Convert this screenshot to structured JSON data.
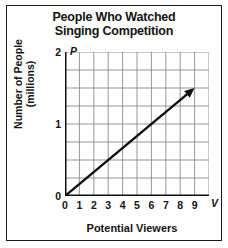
{
  "figure": {
    "title_line1": "People Who Watched",
    "title_line2": "Singing Competition",
    "ylabel_line1": "Number of People",
    "ylabel_line2": "(millions)",
    "xlabel": "Potential Viewers",
    "x_axis_variable": "V",
    "y_axis_variable": "P",
    "frame_color": "#1a1a1a",
    "grid_color": "#8a8a8a",
    "axis_color": "#111111",
    "line_color": "#111111",
    "background_color": "#ffffff"
  },
  "chart_data": {
    "type": "line",
    "title": "People Who Watched Singing Competition",
    "xlabel": "Potential Viewers",
    "ylabel": "Number of People (millions)",
    "x_axis_variable": "V",
    "y_axis_variable": "P",
    "xlim": [
      0,
      10
    ],
    "ylim": [
      0,
      2
    ],
    "xticks": [
      0,
      1,
      2,
      3,
      4,
      5,
      6,
      7,
      8,
      9
    ],
    "xtick_labels": [
      "0",
      "1",
      "2",
      "3",
      "4",
      "5",
      "6",
      "7",
      "8",
      "9"
    ],
    "yticks": [
      0,
      1,
      2
    ],
    "ytick_labels": [
      "0",
      "1",
      "2"
    ],
    "grid": true,
    "grid_x_step": 1,
    "grid_y_step": 0.25,
    "legend": null,
    "series": [
      {
        "name": "People watched vs potential viewers",
        "relationship": "proportional",
        "slope": 0.1667,
        "intercept": 0,
        "arrow_end": true,
        "x": [
          0,
          9
        ],
        "values": [
          0,
          1.5
        ]
      }
    ]
  }
}
